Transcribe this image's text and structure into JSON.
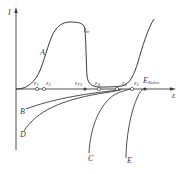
{
  "diagram": {
    "type": "polarization-diagram",
    "axes": {
      "y_label": "I",
      "x_label": "ε"
    },
    "curves": [
      {
        "id": "A",
        "label": "A",
        "description": "anodic passivation curve with maximum current plateau"
      },
      {
        "id": "B",
        "label": "B",
        "description": "cathodic curve"
      },
      {
        "id": "C",
        "label": "C",
        "description": "cathodic curve"
      },
      {
        "id": "D",
        "label": "D",
        "description": "cathodic curve"
      },
      {
        "id": "E",
        "label": "E",
        "description": "cathodic curve"
      }
    ],
    "annotations": {
      "critical_current": {
        "label": "I",
        "subscript": "kr"
      },
      "potentials": [
        {
          "label": "ε",
          "subscript": "1"
        },
        {
          "label": "ε",
          "subscript": "3"
        },
        {
          "label": "ε",
          "subscript": "P2"
        },
        {
          "label": "ε",
          "subscript": "4"
        },
        {
          "label": "ε",
          "subscript": "2"
        },
        {
          "label": "ε",
          "subscript": "5"
        },
        {
          "label": "E",
          "subscript": "Redox"
        }
      ]
    },
    "colors": {
      "line": "#3a3a3a",
      "background": "#ffffff"
    }
  },
  "labels": {
    "y_axis": "I",
    "x_axis": "ε",
    "curve_a": "A",
    "curve_b": "B",
    "curve_c": "C",
    "curve_d": "D",
    "curve_e": "E",
    "ikr_main": "I",
    "ikr_sub": "kr",
    "e1_main": "ε",
    "e1_sub": "1",
    "e3_main": "ε",
    "e3_sub": "3",
    "ep2_main": "ε",
    "ep2_sub": "P2",
    "e4_main": "ε",
    "e4_sub": "4",
    "e2_main": "ε",
    "e2_sub": "2",
    "e5_main": "ε",
    "e5_sub": "5",
    "eredox_main": "E",
    "eredox_sub": "Redox"
  }
}
